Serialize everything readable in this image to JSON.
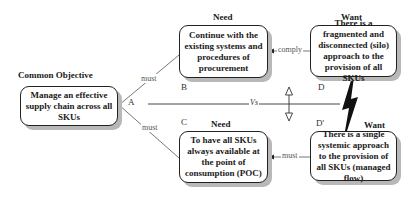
{
  "common_objective": {
    "heading": "Common Objective",
    "text": "Manage an effective supply chain across all SKUs",
    "letter": "A"
  },
  "need_b": {
    "heading": "Need",
    "text": "Continue with the existing systems and procedures of procurement",
    "letter": "B"
  },
  "want_d": {
    "heading": "Want",
    "text": "There is a fragmented and disconnected (silo) approach to the provision of all SKUs",
    "letter": "D"
  },
  "need_c": {
    "heading": "Need",
    "text": "To have all SKUs always available at the point of consumption (POC)",
    "letter": "C"
  },
  "want_d_prime": {
    "heading": "Want",
    "text": "There is a single systemic approach to the provision of all SKUs (managed flow)",
    "letter": "D'"
  },
  "connectors": {
    "a_to_b": "must",
    "a_to_c": "must",
    "d_to_b": "comply",
    "dprime_to_c": "must",
    "versus": "Vs"
  },
  "colors": {
    "border": "#222222",
    "shadow": "#b8b8b8",
    "line": "#444444"
  }
}
